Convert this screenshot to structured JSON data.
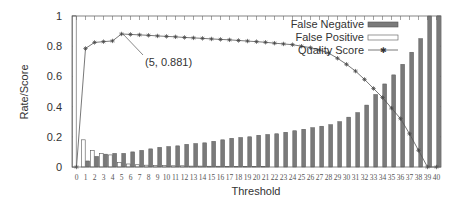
{
  "chart_data": {
    "type": "bar",
    "title": "",
    "xlabel": "Threshold",
    "ylabel": "Rate/Score",
    "ylim": [
      0,
      1
    ],
    "yticks": [
      "0",
      "0.2",
      "0.4",
      "0.6",
      "0.8",
      "1"
    ],
    "categories": [
      "0",
      "1",
      "2",
      "3",
      "4",
      "5",
      "6",
      "7",
      "8",
      "9",
      "10",
      "11",
      "12",
      "13",
      "14",
      "15",
      "16",
      "17",
      "18",
      "19",
      "20",
      "21",
      "22",
      "23",
      "24",
      "25",
      "26",
      "27",
      "28",
      "29",
      "30",
      "31",
      "32",
      "33",
      "34",
      "35",
      "36",
      "37",
      "38",
      "39",
      "40"
    ],
    "legend_position": "top-right",
    "grid": false,
    "series": [
      {
        "name": "False Negative",
        "kind": "bar",
        "color": "#7a7a7a",
        "values": [
          0.0,
          0.04,
          0.07,
          0.085,
          0.09,
          0.09,
          0.1,
          0.11,
          0.12,
          0.13,
          0.135,
          0.14,
          0.15,
          0.155,
          0.16,
          0.17,
          0.18,
          0.19,
          0.195,
          0.2,
          0.21,
          0.215,
          0.22,
          0.23,
          0.24,
          0.25,
          0.26,
          0.27,
          0.28,
          0.3,
          0.33,
          0.36,
          0.41,
          0.48,
          0.55,
          0.61,
          0.68,
          0.76,
          0.85,
          1.0,
          1.0
        ]
      },
      {
        "name": "False Positive",
        "kind": "bar",
        "color": "#ffffff",
        "values": [
          1.0,
          0.18,
          0.11,
          0.09,
          0.08,
          0.03,
          0.02,
          0.015,
          0.012,
          0.01,
          0.01,
          0.008,
          0.008,
          0.006,
          0.006,
          0.005,
          0.005,
          0.004,
          0.004,
          0.003,
          0.003,
          0.003,
          0.002,
          0.002,
          0.002,
          0.002,
          0.001,
          0.001,
          0.001,
          0.001,
          0.001,
          0.0,
          0.0,
          0.0,
          0.0,
          0.0,
          0.0,
          0.0,
          0.0,
          0.0,
          0.0
        ]
      },
      {
        "name": "Quality Score",
        "kind": "line",
        "marker": "asterisk",
        "color": "#555555",
        "values": [
          0.0,
          0.785,
          0.825,
          0.83,
          0.835,
          0.881,
          0.878,
          0.875,
          0.872,
          0.868,
          0.865,
          0.862,
          0.858,
          0.855,
          0.852,
          0.848,
          0.845,
          0.842,
          0.838,
          0.834,
          0.83,
          0.826,
          0.82,
          0.815,
          0.81,
          0.8,
          0.79,
          0.775,
          0.755,
          0.72,
          0.68,
          0.635,
          0.58,
          0.52,
          0.46,
          0.39,
          0.32,
          0.22,
          0.11,
          0.0,
          0.0
        ]
      }
    ],
    "annotations": [
      {
        "text": "(5, 0.881)",
        "x": 5,
        "y": 0.881
      }
    ]
  }
}
